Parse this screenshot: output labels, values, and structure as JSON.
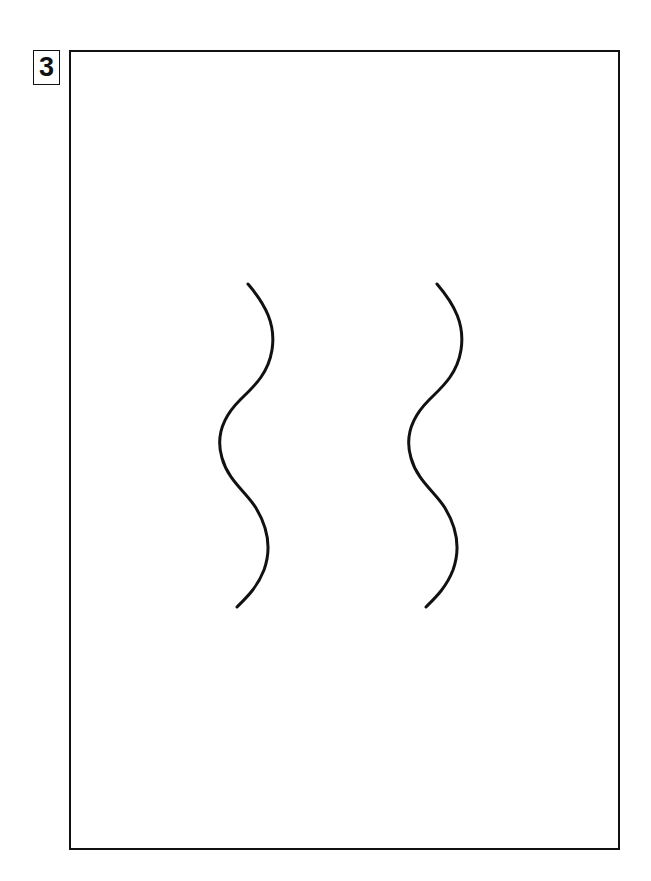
{
  "label": {
    "number": "3"
  },
  "figure": {
    "stroke_color": "#111111",
    "waves": [
      {
        "id": "left",
        "offset_x": 0
      },
      {
        "id": "right",
        "offset_x": 190
      }
    ]
  }
}
